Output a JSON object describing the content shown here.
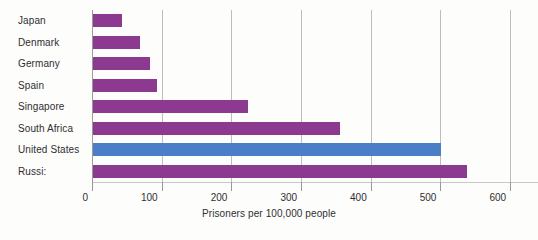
{
  "chart_data": {
    "type": "bar",
    "orientation": "horizontal",
    "title": "",
    "xlabel": "Prisoners per 100,000 people",
    "ylabel": "",
    "categories": [
      "Japan",
      "Denmark",
      "Germany",
      "Spain",
      "Singapore",
      "South Africa",
      "United States",
      "Russi:"
    ],
    "values": [
      42,
      67,
      82,
      92,
      222,
      355,
      500,
      537
    ],
    "series": [
      {
        "name": "Prisoners per 100,000 people",
        "values": [
          42,
          67,
          82,
          92,
          222,
          355,
          500,
          537
        ]
      }
    ],
    "xlim": [
      0,
      640
    ],
    "ylim": [
      0,
      8
    ],
    "xticks": [
      0,
      100,
      200,
      300,
      400,
      500,
      600
    ],
    "xtick_labels": [
      "0",
      "100",
      "200",
      "300",
      "400",
      "500",
      "600"
    ],
    "grid": "vertical",
    "legend": "none",
    "bar_colors": [
      "#8B3A8F",
      "#8B3A8F",
      "#8B3A8F",
      "#8B3A8F",
      "#8B3A8F",
      "#8B3A8F",
      "#4a7fc8",
      "#8B3A8F"
    ],
    "highlight_category": "United States",
    "colors": {
      "bar_default": "#8B3A8F",
      "bar_highlight": "#4a7fc8",
      "gridline": "#bdbdbd",
      "axis": "#9a9a9a",
      "text": "#2f2f2f",
      "background": "#fdfdfc"
    }
  }
}
